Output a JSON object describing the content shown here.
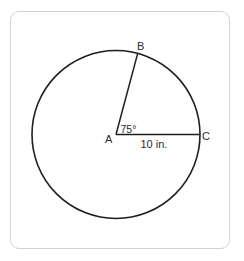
{
  "diagram": {
    "type": "circle-with-central-angle",
    "stroke_color": "#1e1e1e",
    "frame_border_color": "#d4d4d4",
    "center": {
      "label": "A",
      "x": 116,
      "y": 134
    },
    "radius_px": 84,
    "points": [
      {
        "label": "A",
        "role": "center"
      },
      {
        "label": "B",
        "role": "point-on-circle",
        "angle_deg": 75
      },
      {
        "label": "C",
        "role": "point-on-circle",
        "angle_deg": 0
      }
    ],
    "segments": [
      {
        "from": "A",
        "to": "B"
      },
      {
        "from": "A",
        "to": "C",
        "label": "10 in."
      }
    ],
    "angle": {
      "vertex": "A",
      "between": [
        "B",
        "C"
      ],
      "label": "75°"
    },
    "labels": {
      "A": "A",
      "B": "B",
      "C": "C",
      "angle": "75°",
      "radius": "10 in."
    }
  }
}
